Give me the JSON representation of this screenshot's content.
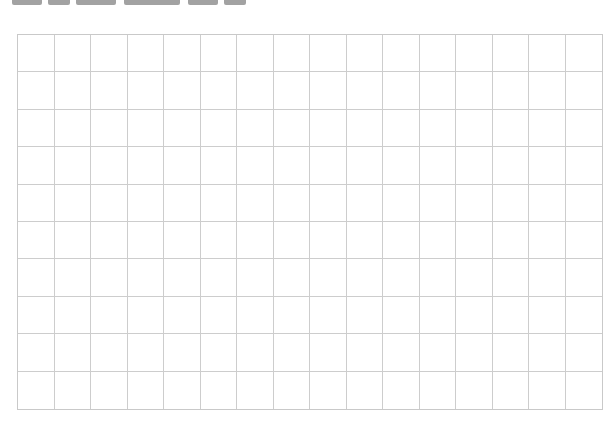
{
  "page": {
    "background": "#ffffff",
    "heading_clipped": true
  },
  "grid": {
    "columns": 16,
    "rows": 10,
    "line_color": "#cdcdcd",
    "border_color": "#c9c9c9",
    "cell_values": []
  }
}
